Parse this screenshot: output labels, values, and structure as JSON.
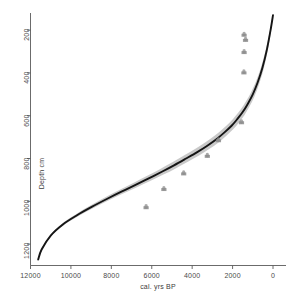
{
  "chart_data": {
    "type": "line",
    "title": "",
    "subtitle": "",
    "xlabel": "cal. yrs BP",
    "ylabel": "Depth cm",
    "xlim": [
      12000,
      0
    ],
    "ylim": [
      120,
      1300
    ],
    "x_reversed": true,
    "y_reversed": true,
    "grid": false,
    "legend": null,
    "xticks": [
      12000,
      10000,
      8000,
      6000,
      4000,
      2000,
      0
    ],
    "xtick_labels": [
      "12000",
      "10000",
      "8000",
      "6000",
      "4000",
      "2000",
      "0"
    ],
    "yticks": [
      200,
      400,
      600,
      800,
      1000,
      1200
    ],
    "ytick_labels": [
      "200",
      "400",
      "600",
      "800",
      "1000",
      "1200"
    ],
    "series": [
      {
        "name": "age-depth model",
        "type": "line",
        "color": "#1a1a1a",
        "x": [
          0,
          120,
          300,
          520,
          760,
          1000,
          1250,
          1500,
          1760,
          2050,
          2400,
          2800,
          3250,
          3750,
          4300,
          4900,
          5500,
          6150,
          6800,
          7500,
          8200,
          8950,
          9700,
          10400,
          11000,
          11450,
          11620
        ],
        "y": [
          130,
          200,
          290,
          375,
          445,
          500,
          545,
          583,
          615,
          647,
          678,
          710,
          740,
          770,
          800,
          832,
          862,
          893,
          923,
          955,
          988,
          1025,
          1065,
          1108,
          1160,
          1225,
          1272
        ]
      },
      {
        "name": "95% confidence envelope",
        "type": "area",
        "color": "#9a9a9a"
      },
      {
        "name": "calibrated dates",
        "type": "scatter",
        "color": "#8c8c8c",
        "points": [
          {
            "x": 1430,
            "y": 224
          },
          {
            "x": 1360,
            "y": 248
          },
          {
            "x": 1430,
            "y": 305
          },
          {
            "x": 1440,
            "y": 400
          },
          {
            "x": 1560,
            "y": 633
          },
          {
            "x": 2700,
            "y": 717
          },
          {
            "x": 3250,
            "y": 790
          },
          {
            "x": 4420,
            "y": 872
          },
          {
            "x": 5400,
            "y": 945
          },
          {
            "x": 6280,
            "y": 1030
          }
        ]
      }
    ]
  },
  "axes": {
    "y_title": "Depth cm",
    "x_title": "cal. yrs BP"
  }
}
